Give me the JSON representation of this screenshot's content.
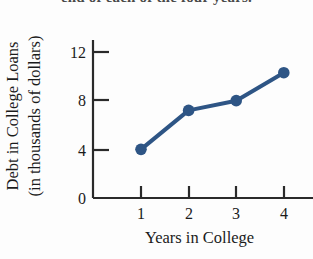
{
  "figure": {
    "top_clipped_text": "end of each of the four years.",
    "background_color": "#fdfdfd"
  },
  "chart_data": {
    "type": "line",
    "title": "",
    "xlabel": "Years in College",
    "ylabel": "Debt in College Loans (in thousands of dollars)",
    "ylabel_line1": "Debt in College Loans",
    "ylabel_line2": "(in thousands of dollars)",
    "x": [
      1,
      2,
      3,
      4
    ],
    "values": [
      4.0,
      7.2,
      8.0,
      10.3
    ],
    "xtick_labels": [
      "1",
      "2",
      "3",
      "4"
    ],
    "ytick_labels": [
      "0",
      "4",
      "8",
      "12"
    ],
    "yticks": [
      0,
      4,
      8,
      12
    ],
    "xlim": [
      0.45,
      4.55
    ],
    "ylim": [
      0,
      13.2
    ],
    "grid": false,
    "legend": false,
    "series_color": "#2e5585",
    "marker": "circle",
    "marker_size": 7,
    "line_width": 4
  }
}
